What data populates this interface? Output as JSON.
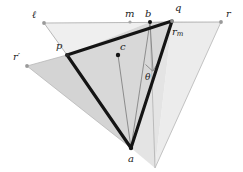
{
  "figure": {
    "type": "geometry-diagram",
    "width": 243,
    "height": 172,
    "background": "#ffffff",
    "colors": {
      "thick_stroke": "#1a1a1a",
      "thin_stroke": "#8c8c8c",
      "very_light_fill": "#efefef",
      "light_fill": "#e2e2e2",
      "mid_fill": "#d2d2d2",
      "label_text": "#1b1b1b",
      "dot_dark": "#151515",
      "dot_gray": "#9a9a9a"
    },
    "labels": {
      "ell": "ℓ",
      "m": "m",
      "b": "b",
      "q": "q",
      "r": "r",
      "r_prime": "r′",
      "r_m_base": "r",
      "r_m_sub": "m",
      "p": "p",
      "c": "c",
      "a": "a",
      "theta": "θ"
    },
    "points": {
      "ell": {
        "x": 44,
        "y": 23
      },
      "m": {
        "x": 130,
        "y": 22
      },
      "b": {
        "x": 150,
        "y": 22
      },
      "q": {
        "x": 172,
        "y": 21
      },
      "r": {
        "x": 221,
        "y": 22
      },
      "r_prime": {
        "x": 27,
        "y": 66
      },
      "p": {
        "x": 67,
        "y": 55
      },
      "c": {
        "x": 118,
        "y": 55
      },
      "a": {
        "x": 131,
        "y": 148
      },
      "foot": {
        "x": 152,
        "y": 70
      },
      "s": {
        "x": 155,
        "y": 168
      }
    },
    "label_positions": {
      "ell": {
        "x": 32,
        "y": 10
      },
      "m": {
        "x": 125,
        "y": 8
      },
      "b": {
        "x": 145,
        "y": 8
      },
      "q": {
        "x": 174,
        "y": 3
      },
      "r": {
        "x": 226,
        "y": 9
      },
      "r_prime": {
        "x": 13,
        "y": 53
      },
      "r_m": {
        "x": 172,
        "y": 27
      },
      "p": {
        "x": 56,
        "y": 42
      },
      "c": {
        "x": 119,
        "y": 42
      },
      "a": {
        "x": 127,
        "y": 155
      },
      "theta": {
        "x": 144,
        "y": 74
      }
    },
    "shapes": {
      "very_light_triangle": "ell-b-p",
      "light_triangle": "q/r-s-b",
      "mid_triangle": "r_prime-p-a",
      "main_thick_triangle": "p-q-a",
      "thin_lines": [
        "ell-p",
        "r-s",
        "b-foot",
        "c-a",
        "b-a",
        "horizontal-baseline"
      ],
      "right_angle_marker_at": "foot"
    }
  }
}
